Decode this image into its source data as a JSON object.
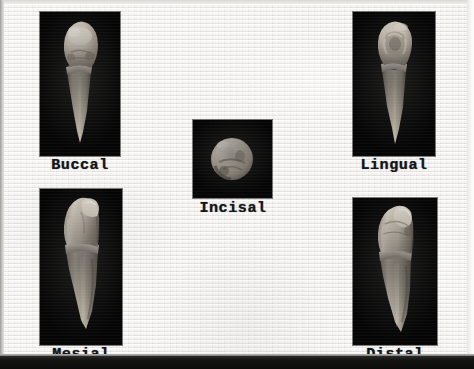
{
  "plate": {
    "width": 474,
    "height": 369,
    "background_color": "#eeedea",
    "panel_color": "#050505",
    "caption_color": "#16161a",
    "specimen_color": "#cfc6b8"
  },
  "specimens": [
    {
      "id": "buccal",
      "label": "Buccal",
      "icon": "tooth-buccal-view",
      "panel": {
        "x": 40,
        "y": 12,
        "width": 80,
        "height": 144
      },
      "caption": {
        "x": 28,
        "y": 158,
        "width": 104
      }
    },
    {
      "id": "lingual",
      "label": "Lingual",
      "icon": "tooth-lingual-view",
      "panel": {
        "x": 353,
        "y": 12,
        "width": 82,
        "height": 144
      },
      "caption": {
        "x": 340,
        "y": 158,
        "width": 108
      }
    },
    {
      "id": "incisal",
      "label": "Incisal",
      "icon": "tooth-incisal-view",
      "panel": {
        "x": 193,
        "y": 120,
        "width": 79,
        "height": 78
      },
      "caption": {
        "x": 182,
        "y": 201,
        "width": 102
      }
    },
    {
      "id": "mesial",
      "label": "Mesial",
      "icon": "tooth-mesial-view",
      "panel": {
        "x": 40,
        "y": 189,
        "width": 82,
        "height": 156
      },
      "caption": {
        "x": 28,
        "y": 347,
        "width": 106
      }
    },
    {
      "id": "distal",
      "label": "Distal",
      "icon": "tooth-distal-view",
      "panel": {
        "x": 353,
        "y": 198,
        "width": 84,
        "height": 147
      },
      "caption": {
        "x": 342,
        "y": 347,
        "width": 106
      }
    }
  ]
}
